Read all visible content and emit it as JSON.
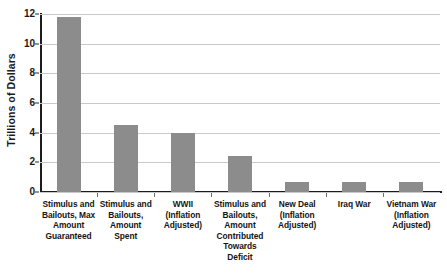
{
  "chart_data": {
    "type": "bar",
    "title": "",
    "xlabel": "",
    "ylabel": "Trillions of Dollars",
    "ylim": [
      0,
      12
    ],
    "yticks": [
      0,
      2,
      4,
      6,
      8,
      10,
      12
    ],
    "ytick_labels": [
      "0",
      "2",
      "4",
      "6",
      "8",
      "10",
      "12"
    ],
    "grid": true,
    "legend": "none",
    "categories": [
      "Stimulus and Bailouts, Max Amount Guaranteed",
      "Stimulus and Bailouts, Amount Spent",
      "WWII (Inflation Adjusted)",
      "Stimulus and Bailouts, Amount Contributed Towards Deficit",
      "New Deal (Inflation Adjusted)",
      "Iraq War",
      "Vietnam War (Inflation Adjusted)"
    ],
    "values": [
      11.8,
      4.5,
      4.0,
      2.4,
      0.7,
      0.65,
      0.7
    ],
    "bar_color": "#8c8c8c",
    "grid_color": "#c9c9c9",
    "axis_color": "#1c1c1c"
  },
  "axis": {
    "y_title": "Trillions of Dollars"
  },
  "x_labels": [
    {
      "lines": [
        "Stimulus and",
        "Bailouts, Max",
        "Amount",
        "Guaranteed"
      ]
    },
    {
      "lines": [
        "Stimulus and",
        "Bailouts,",
        "Amount",
        "Spent"
      ]
    },
    {
      "lines": [
        "WWII",
        "(Inflation",
        "Adjusted)"
      ]
    },
    {
      "lines": [
        "Stimulus and",
        "Bailouts,",
        "Amount",
        "Contributed",
        "Towards Deficit"
      ]
    },
    {
      "lines": [
        "New Deal",
        "(Inflation",
        "Adjusted)"
      ]
    },
    {
      "lines": [
        "Iraq War"
      ]
    },
    {
      "lines": [
        "Vietnam War",
        "(Inflation",
        "Adjusted)"
      ]
    }
  ]
}
